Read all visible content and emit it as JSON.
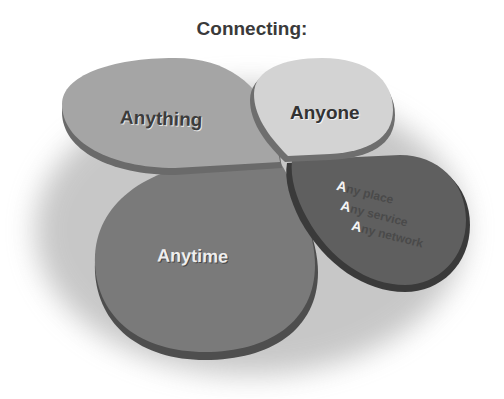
{
  "title": "Connecting:",
  "petals": {
    "anything": {
      "label": "Anything",
      "color": "#a5a5a5"
    },
    "anyone": {
      "label": "Anyone",
      "color": "#d3d3d3"
    },
    "anytime": {
      "label": "Anytime",
      "color": "#7a7a7a"
    },
    "any": {
      "color": "#5f5f5f",
      "items": [
        {
          "cap": "A",
          "rest": "ny place"
        },
        {
          "cap": "A",
          "rest": "ny service"
        },
        {
          "cap": "A",
          "rest": "ny network"
        }
      ]
    }
  },
  "colors": {
    "shadow": "#cfcfcf",
    "edge_dark": "#4a4a4a",
    "background": "#ffffff"
  }
}
